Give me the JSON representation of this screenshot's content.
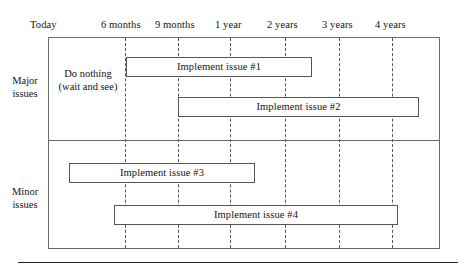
{
  "chart_data": {
    "type": "bar",
    "title": "",
    "subtitle": "",
    "xlabel": "",
    "ylabel": "",
    "orientation": "horizontal",
    "style": "gantt-roadmap",
    "grid": true,
    "legend": null,
    "axis": {
      "tick_labels": [
        "Today",
        "6 months",
        "9 months",
        "1 year",
        "2 years",
        "3 years",
        "4 years"
      ],
      "tick_x_px": [
        48,
        125,
        178,
        230,
        285,
        339,
        392
      ],
      "range_px": [
        48,
        440
      ]
    },
    "categories": [
      "Major issues",
      "Minor issues"
    ],
    "annotations": [
      "Do nothing (wait and see)"
    ],
    "series": [
      {
        "name": "Implement issue #1",
        "category": "Major issues",
        "start_label": "6 months",
        "end_label": "3 years",
        "start_px": 126,
        "end_px": 312,
        "row_top_px": 57
      },
      {
        "name": "Implement issue #2",
        "category": "Major issues",
        "start_label": "9 months",
        "end_label": "beyond 4 years",
        "start_px": 178,
        "end_px": 419,
        "row_top_px": 97
      },
      {
        "name": "Implement issue #3",
        "category": "Minor issues",
        "start_label": "Today",
        "end_label": "2 years",
        "start_px": 69,
        "end_px": 255,
        "row_top_px": 163
      },
      {
        "name": "Implement issue #4",
        "category": "Minor issues",
        "start_label": "6 months",
        "end_label": "4 years",
        "start_px": 114,
        "end_px": 398,
        "row_top_px": 205
      }
    ]
  },
  "axis": {
    "ticks": [
      {
        "label": "Today",
        "x": 30,
        "gridline": false,
        "grid_x": 48
      },
      {
        "label": "6 months",
        "x": 101,
        "gridline": true,
        "grid_x": 125
      },
      {
        "label": "9 months",
        "x": 155,
        "gridline": true,
        "grid_x": 178
      },
      {
        "label": "1 year",
        "x": 215,
        "gridline": true,
        "grid_x": 230
      },
      {
        "label": "2 years",
        "x": 267,
        "gridline": true,
        "grid_x": 285
      },
      {
        "label": "3 years",
        "x": 322,
        "gridline": true,
        "grid_x": 339
      },
      {
        "label": "4 years",
        "x": 375,
        "gridline": true,
        "grid_x": 392
      }
    ]
  },
  "rows": {
    "major": {
      "label_line1": "Major",
      "label_line2": "issues"
    },
    "minor": {
      "label_line1": "Minor",
      "label_line2": "issues"
    }
  },
  "notes": {
    "do_nothing_line1": "Do nothing",
    "do_nothing_line2": "(wait and see)"
  },
  "bars": [
    {
      "label": "Implement issue #1",
      "left": 126,
      "top": 57,
      "width": 186
    },
    {
      "label": "Implement issue #2",
      "left": 178,
      "top": 97,
      "width": 241
    },
    {
      "label": "Implement issue #3",
      "left": 69,
      "top": 163,
      "width": 186
    },
    {
      "label": "Implement issue #4",
      "left": 114,
      "top": 205,
      "width": 284
    }
  ],
  "colors": {
    "frame_stroke": "#6b6b6b",
    "bar_stroke": "#555555",
    "gridline": "#555555",
    "text": "#141414",
    "rule": "#232323",
    "background": "#ffffff"
  }
}
